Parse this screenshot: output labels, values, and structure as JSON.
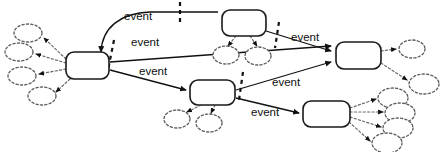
{
  "diagram": {
    "type": "state-transition-diagram",
    "title": "",
    "canvas": {
      "width": 447,
      "height": 152,
      "background": "#ffffff"
    },
    "colors": {
      "state_stroke": "#1a1a1a",
      "state_fill": "#ffffff",
      "cloud_stroke": "#5a5a5a",
      "edge_stroke": "#111111",
      "dotted_edge_stroke": "#6a6a6a",
      "label_text": "#111111"
    },
    "states": [
      {
        "id": "s1",
        "label": "",
        "x": 66,
        "y": 52,
        "w": 43,
        "h": 27,
        "rx": 8
      },
      {
        "id": "s2",
        "label": "",
        "x": 222,
        "y": 10,
        "w": 44,
        "h": 26,
        "rx": 8
      },
      {
        "id": "s3",
        "label": "",
        "x": 336,
        "y": 42,
        "w": 45,
        "h": 27,
        "rx": 8
      },
      {
        "id": "s4",
        "label": "",
        "x": 190,
        "y": 80,
        "w": 45,
        "h": 25,
        "rx": 8
      },
      {
        "id": "s5",
        "label": "",
        "x": 303,
        "y": 101,
        "w": 47,
        "h": 26,
        "rx": 8
      }
    ],
    "transitions": [
      {
        "id": "t1",
        "from": "s1",
        "to": "s2",
        "label": "event",
        "label_x": 124,
        "label_y": 20,
        "barrier": true
      },
      {
        "id": "t2",
        "from": "s1",
        "to": "s3",
        "label": "event",
        "label_x": 131,
        "label_y": 46,
        "barrier": true
      },
      {
        "id": "t3",
        "from": "s1",
        "to": "s4",
        "label": "event",
        "label_x": 139,
        "label_y": 75,
        "barrier": false
      },
      {
        "id": "t4",
        "from": "s2",
        "to": "s3",
        "label": "event",
        "label_x": 291,
        "label_y": 41,
        "barrier": true
      },
      {
        "id": "t5",
        "from": "s4",
        "to": "s3",
        "label": "event",
        "label_x": 272,
        "label_y": 86,
        "barrier": true
      },
      {
        "id": "t6",
        "from": "s4",
        "to": "s5",
        "label": "event",
        "label_x": 251,
        "label_y": 116,
        "barrier": true
      }
    ],
    "clouds": [
      {
        "id": "c1",
        "parent": "s1",
        "cx": 28,
        "cy": 33,
        "rx": 14,
        "ry": 9
      },
      {
        "id": "c2",
        "parent": "s1",
        "cx": 19,
        "cy": 52,
        "rx": 14,
        "ry": 9
      },
      {
        "id": "c3",
        "parent": "s1",
        "cx": 22,
        "cy": 76,
        "rx": 14,
        "ry": 9
      },
      {
        "id": "c4",
        "parent": "s1",
        "cx": 42,
        "cy": 96,
        "rx": 14,
        "ry": 9
      },
      {
        "id": "c5",
        "parent": "s2",
        "cx": 226,
        "cy": 55,
        "rx": 13,
        "ry": 9
      },
      {
        "id": "c6",
        "parent": "s2",
        "cx": 258,
        "cy": 56,
        "rx": 13,
        "ry": 9
      },
      {
        "id": "c7",
        "parent": "s4",
        "cx": 177,
        "cy": 119,
        "rx": 13,
        "ry": 9
      },
      {
        "id": "c8",
        "parent": "s4",
        "cx": 209,
        "cy": 123,
        "rx": 13,
        "ry": 9
      },
      {
        "id": "c9",
        "parent": "s3",
        "cx": 412,
        "cy": 49,
        "rx": 13,
        "ry": 9
      },
      {
        "id": "c10",
        "parent": "s3",
        "cx": 424,
        "cy": 84,
        "rx": 15,
        "ry": 10
      },
      {
        "id": "c11",
        "parent": "s5",
        "cx": 393,
        "cy": 98,
        "rx": 15,
        "ry": 10
      },
      {
        "id": "c12",
        "parent": "s5",
        "cx": 400,
        "cy": 113,
        "rx": 15,
        "ry": 10
      },
      {
        "id": "c13",
        "parent": "s5",
        "cx": 398,
        "cy": 128,
        "rx": 15,
        "ry": 10
      },
      {
        "id": "c14",
        "parent": "s5",
        "cx": 387,
        "cy": 143,
        "rx": 15,
        "ry": 10
      }
    ],
    "event_labels": [
      "event",
      "event",
      "event",
      "event",
      "event",
      "event"
    ]
  }
}
